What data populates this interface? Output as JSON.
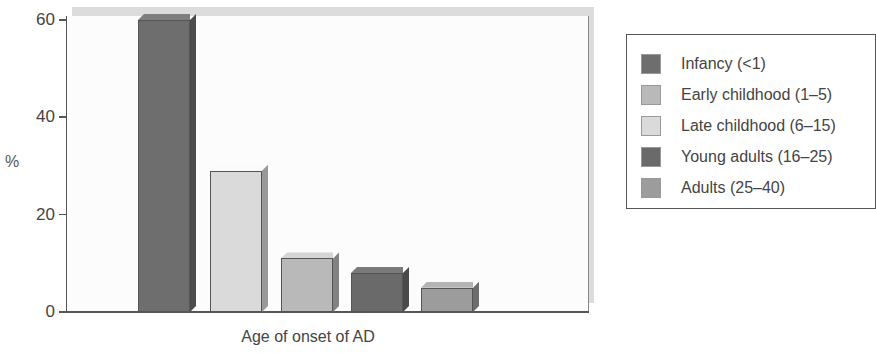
{
  "chart_data": {
    "type": "bar",
    "title": "",
    "xlabel": "Age of onset of AD",
    "ylabel": "%",
    "ylim": [
      0,
      60
    ],
    "yticks": [
      0,
      20,
      40,
      60
    ],
    "grid": false,
    "legend_position": "right",
    "style": "3d",
    "categories": [
      "Infancy (<1)",
      "Late childhood (6–15)",
      "Early childhood (1–5)",
      "Young adults (16–25)",
      "Adults (25–40)"
    ],
    "values": [
      60,
      29,
      11,
      8,
      5
    ],
    "series": [
      {
        "name": "Infancy (<1)",
        "value": 60,
        "color": "#6e6e6e"
      },
      {
        "name": "Late childhood (6–15)",
        "value": 29,
        "color": "#dadada"
      },
      {
        "name": "Early childhood (1–5)",
        "value": 11,
        "color": "#b9b9b9"
      },
      {
        "name": "Young adults (16–25)",
        "value": 8,
        "color": "#6a6a6a"
      },
      {
        "name": "Adults (25–40)",
        "value": 5,
        "color": "#9c9c9c"
      }
    ],
    "legend": [
      {
        "label": "Infancy (<1)",
        "color": "#6e6e6e"
      },
      {
        "label": "Early childhood (1–5)",
        "color": "#b9b9b9"
      },
      {
        "label": "Late childhood (6–15)",
        "color": "#dadada"
      },
      {
        "label": "Young adults (16–25)",
        "color": "#6a6a6a"
      },
      {
        "label": "Adults (25–40)",
        "color": "#9c9c9c"
      }
    ]
  },
  "axes": {
    "y_title": "%",
    "x_title": "Age of onset of AD",
    "y_tick_labels": [
      "0",
      "20",
      "40",
      "60"
    ]
  }
}
